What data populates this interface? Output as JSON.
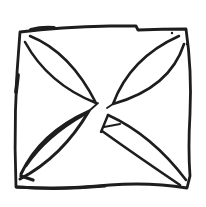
{
  "figure": {
    "background_color": "#ffffff",
    "ink_color": "#1d1d1d",
    "canvas": {
      "width": 206,
      "height": 207
    },
    "strokes": [
      {
        "name": "square-outline",
        "width": 2.8,
        "path": "M 20 32 Q 60 27 110 26 L 136 26 L 138 30 Q 162 29 186 29 Q 192 70 190 114 Q 188 148 190 176 L 187 188 Q 150 182 110 185 Q 60 190 16 187 Q 13 110 20 32 Z"
      },
      {
        "name": "square-top-edge-overdraw",
        "width": 4.2,
        "path": "M 31 30 Q 42 27 54 28"
      },
      {
        "name": "square-left-edge-overdraw",
        "width": 3.8,
        "path": "M 18 75 L 16 92"
      },
      {
        "name": "square-bottom-edge-overdraw",
        "width": 3.2,
        "path": "M 17 187 Q 60 190 105 186"
      },
      {
        "name": "leaf-top-left",
        "width": 2.6,
        "path": "M 30 36 Q 70 52 96 103 Q 48 84 25 42"
      },
      {
        "name": "leaf-top-right",
        "width": 2.6,
        "path": "M 179 36 Q 130 58 113 104 Q 170 88 184 44"
      },
      {
        "name": "leaf-top-right-tip-flick",
        "width": 1.8,
        "path": "M 113 104 L 107 108"
      },
      {
        "name": "leaf-bottom-left",
        "width": 3.0,
        "path": "M 21 174 Q 40 133 89 111 Q 62 157 20 179"
      },
      {
        "name": "leaf-bottom-left-overdraw",
        "width": 2.6,
        "path": "M 26 166 Q 46 136 85 114"
      },
      {
        "name": "leaf-bottom-left-end-tick",
        "width": 3.4,
        "path": "M 21 176 L 33 180"
      },
      {
        "name": "leaf-bottom-left-tip-flick",
        "width": 1.8,
        "path": "M 89 111 L 98 103"
      },
      {
        "name": "leaf-bottom-right-upper-edge",
        "width": 2.6,
        "path": "M 108 115 Q 152 135 186 180"
      },
      {
        "name": "leaf-bottom-right-lower-edge",
        "width": 2.6,
        "path": "M 102 131 Q 137 156 180 185"
      },
      {
        "name": "leaf-bottom-right-tip-spur",
        "width": 2.4,
        "path": "M 108 115 L 101 132"
      },
      {
        "name": "leaf-bottom-right-tip-crossbar",
        "width": 2.2,
        "path": "M 104 127 L 120 124"
      }
    ],
    "dots": [
      {
        "name": "ink-speck-top-right-1",
        "cx": 172,
        "cy": 33,
        "r": 1.2
      },
      {
        "name": "ink-speck-top-right-2",
        "cx": 187,
        "cy": 44,
        "r": 1.2
      }
    ]
  }
}
